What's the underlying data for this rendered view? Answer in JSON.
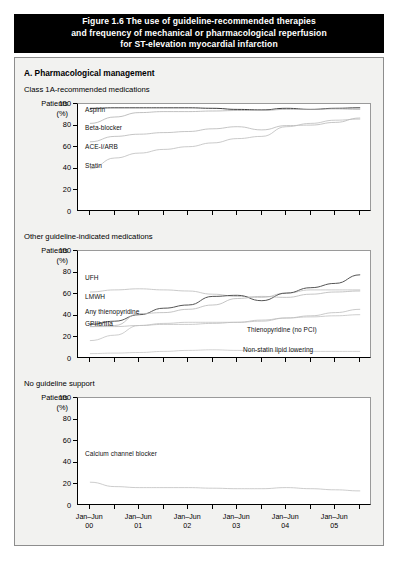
{
  "title": {
    "line1": "Figure 1.6 The use of guideline-recommended therapies",
    "line2": "and frequency of mechanical or pharmacological reperfusion",
    "line3": "for ST-elevation myocardial infarction"
  },
  "section": {
    "heading": "A. Pharmacological management"
  },
  "axis": {
    "y_title_line1": "Patients",
    "y_title_line2": "(%)"
  },
  "chart_data": [
    {
      "type": "line",
      "title": "Class 1A-recommended medications",
      "xlabel": "",
      "ylabel": "Patients (%)",
      "ylim": [
        0,
        100
      ],
      "yticks": [
        0,
        20,
        40,
        60,
        80,
        100
      ],
      "grid": false,
      "legend": "inline-labels",
      "x": [
        "Jan-Jun 00",
        "Jul-Dec 00",
        "Jan-Jun 01",
        "Jul-Dec 01",
        "Jan-Jun 02",
        "Jul-Dec 02",
        "Jan-Jun 03",
        "Jul-Dec 03",
        "Jan-Jun 04",
        "Jul-Dec 04",
        "Jan-Jun 05",
        "Jul-Dec 05"
      ],
      "series": [
        {
          "name": "Aspirin",
          "values": [
            96,
            96.5,
            96.5,
            96.5,
            96.5,
            96,
            95,
            94.5,
            96,
            95,
            96,
            96.5
          ]
        },
        {
          "name": "Beta-blocker",
          "values": [
            82,
            88,
            92,
            93,
            93,
            93.5,
            94,
            94,
            95,
            95,
            95.5,
            95
          ]
        },
        {
          "name": "ACE-I/ARB",
          "values": [
            65,
            70,
            72,
            73.5,
            74.5,
            77,
            79,
            76,
            80,
            80.5,
            83,
            87
          ]
        },
        {
          "name": "Statin",
          "values": [
            40,
            50,
            54.5,
            58,
            60.5,
            64,
            68,
            70,
            79,
            82,
            85,
            86
          ]
        }
      ]
    },
    {
      "type": "line",
      "title": "Other guideline-indicated medications",
      "xlabel": "",
      "ylabel": "Patients (%)",
      "ylim": [
        0,
        100
      ],
      "yticks": [
        0,
        20,
        40,
        60,
        80,
        100
      ],
      "grid": false,
      "legend": "inline-labels",
      "x": [
        "Jan-Jun 00",
        "Jul-Dec 00",
        "Jan-Jun 01",
        "Jul-Dec 01",
        "Jan-Jun 02",
        "Jul-Dec 02",
        "Jan-Jun 03",
        "Jul-Dec 03",
        "Jan-Jun 04",
        "Jul-Dec 04",
        "Jan-Jun 05",
        "Jul-Dec 05"
      ],
      "series": [
        {
          "name": "UFH",
          "values": [
            62,
            64,
            65,
            64,
            63,
            60,
            58,
            57,
            61,
            64,
            64,
            64
          ]
        },
        {
          "name": "LMWH",
          "values": [
            32,
            35,
            41,
            47,
            50,
            58,
            59,
            54,
            61,
            66,
            70,
            78
          ]
        },
        {
          "name": "Any thienopyridine",
          "values": [
            30,
            31,
            42,
            43,
            46,
            50,
            56,
            58,
            57,
            60,
            62,
            63
          ]
        },
        {
          "name": "GPIIb/IIIa",
          "values": [
            17,
            22,
            31,
            33,
            34,
            34,
            34,
            35,
            38,
            39,
            40,
            41
          ]
        },
        {
          "name": "Thienopyridine (no PCI)",
          "values": [
            30,
            30,
            31,
            32,
            32,
            33,
            34,
            36,
            38,
            40,
            43,
            46
          ]
        },
        {
          "name": "Non-statin lipid lowering",
          "values": [
            5,
            5.5,
            6,
            7,
            8,
            8.5,
            8,
            7.5,
            7,
            7,
            7,
            7
          ]
        }
      ]
    },
    {
      "type": "line",
      "title": "No guideline support",
      "xlabel": "",
      "ylabel": "Patients (%)",
      "ylim": [
        0,
        100
      ],
      "yticks": [
        0,
        20,
        40,
        60,
        80,
        100
      ],
      "grid": false,
      "legend": "inline-labels",
      "x": [
        "Jan-Jun 00",
        "Jul-Dec 00",
        "Jan-Jun 01",
        "Jul-Dec 01",
        "Jan-Jun 02",
        "Jul-Dec 02",
        "Jan-Jun 03",
        "Jul-Dec 03",
        "Jan-Jun 04",
        "Jul-Dec 04",
        "Jan-Jun 05",
        "Jul-Dec 05"
      ],
      "series": [
        {
          "name": "Calcium channel blocker",
          "values": [
            22,
            18,
            17,
            17,
            17,
            16.5,
            16,
            16,
            17,
            16,
            15,
            14
          ]
        }
      ]
    }
  ],
  "xaxis": {
    "tick_labels": [
      {
        "top": "Jan–Jun",
        "bottom": "00"
      },
      {
        "top": "Jan–Jun",
        "bottom": "01"
      },
      {
        "top": "Jan–Jun",
        "bottom": "02"
      },
      {
        "top": "Jan–Jun",
        "bottom": "03"
      },
      {
        "top": "Jan–Jun",
        "bottom": "04"
      },
      {
        "top": "Jan–Jun",
        "bottom": "05"
      }
    ],
    "tick_count": 12
  },
  "colors": {
    "banner_bg": "#000000",
    "banner_text": "#ffffff",
    "panel_bg": "#f2f2f0",
    "plot_bg": "#ffffff",
    "axis": "#000000",
    "series_dark": "#4a4a4a",
    "series_light": "#b4b4b4"
  }
}
